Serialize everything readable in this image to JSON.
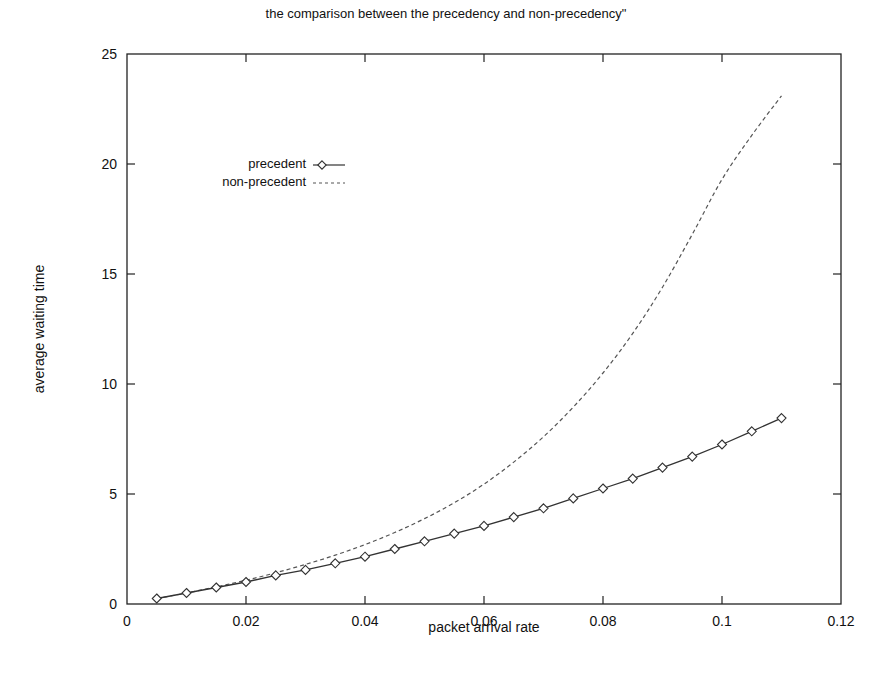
{
  "chart_data": {
    "type": "line",
    "title": "the comparison between the precedency and non-precedency\"",
    "xlabel": "packet arrival rate",
    "ylabel": "average waiting time",
    "xlim": [
      0,
      0.12
    ],
    "ylim": [
      0,
      25
    ],
    "xticks": [
      0,
      0.02,
      0.04,
      0.06,
      0.08,
      0.1,
      0.12
    ],
    "xtick_labels": [
      "0",
      "0.02",
      "0.04",
      "0.06",
      "0.08",
      "0.1",
      "0.12"
    ],
    "yticks": [
      0,
      5,
      10,
      15,
      20,
      25
    ],
    "ytick_labels": [
      "0",
      "5",
      "10",
      "15",
      "20",
      "25"
    ],
    "grid": false,
    "legend_position": "upper-left inside",
    "x": [
      0.005,
      0.01,
      0.015,
      0.02,
      0.025,
      0.03,
      0.035,
      0.04,
      0.045,
      0.05,
      0.055,
      0.06,
      0.065,
      0.07,
      0.075,
      0.08,
      0.085,
      0.09,
      0.095,
      0.1,
      0.105,
      0.11
    ],
    "series": [
      {
        "name": "precedent",
        "style": "solid line with diamond markers",
        "values": [
          0.25,
          0.5,
          0.75,
          1.0,
          1.3,
          1.55,
          1.85,
          2.15,
          2.5,
          2.85,
          3.2,
          3.55,
          3.95,
          4.35,
          4.8,
          5.25,
          5.7,
          6.2,
          6.7,
          7.25,
          7.85,
          8.45
        ]
      },
      {
        "name": "non-precedent",
        "style": "dashed line",
        "values": [
          0.25,
          0.5,
          0.78,
          1.08,
          1.42,
          1.8,
          2.22,
          2.7,
          3.25,
          3.88,
          4.6,
          5.45,
          6.45,
          7.6,
          8.95,
          10.5,
          12.3,
          14.4,
          16.8,
          19.3,
          21.3,
          23.1
        ]
      }
    ]
  },
  "colors": {
    "axis": "#222222",
    "precedent_line": "#333333",
    "non_precedent_line": "#555555",
    "background": "#ffffff"
  }
}
